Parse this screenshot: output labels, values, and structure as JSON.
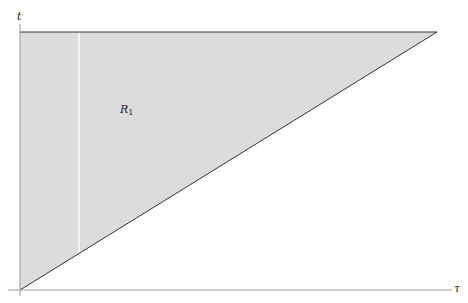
{
  "diagram": {
    "axes": {
      "y_label": "t",
      "x_label": "τ"
    },
    "region": {
      "label_main": "R",
      "label_sub": "1",
      "fill": "#dcdcdc",
      "stroke": "#333333"
    },
    "colors": {
      "axis": "#9a9a9a",
      "background": "#ffffff"
    }
  }
}
